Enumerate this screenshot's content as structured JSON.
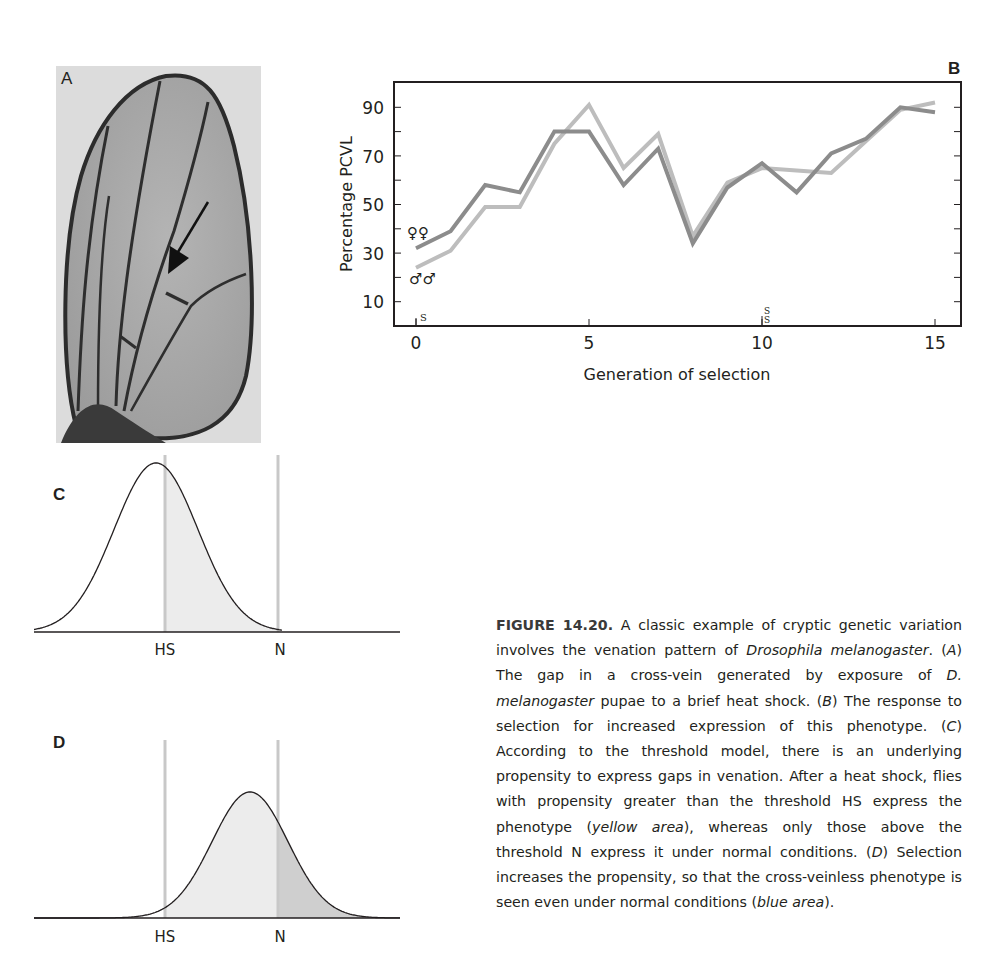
{
  "panels": {
    "A": {
      "label": "A",
      "description": "Drosophila wing photo with arrow pointing at gap in cross-vein"
    },
    "B": {
      "label": "B"
    },
    "C": {
      "label": "C"
    },
    "D": {
      "label": "D"
    }
  },
  "chart_data": [
    {
      "panel": "B",
      "type": "line",
      "title": "",
      "xlabel": "Generation of selection",
      "ylabel": "Percentage PCVL",
      "xlim": [
        0,
        15
      ],
      "ylim": [
        0,
        100
      ],
      "x_ticks": [
        0,
        5,
        10,
        15
      ],
      "y_ticks": [
        10,
        30,
        50,
        70,
        90
      ],
      "y_minor_ticks": [
        20,
        40,
        60,
        80
      ],
      "grid": false,
      "x": [
        0,
        1,
        2,
        3,
        4,
        5,
        6,
        7,
        8,
        9,
        10,
        11,
        12,
        13,
        14,
        15
      ],
      "series": [
        {
          "name": "♀♀ (females)",
          "symbol": "♀♀",
          "color": "#8c8c8c",
          "values": [
            32,
            39,
            58,
            55,
            80,
            80,
            58,
            73,
            34,
            57,
            67,
            55,
            71,
            77,
            90,
            88
          ]
        },
        {
          "name": "♂♂ (males)",
          "symbol": "♂♂",
          "color": "#bdbdbd",
          "values": [
            24,
            31,
            49,
            49,
            75,
            91,
            65,
            79,
            37,
            59,
            65,
            64,
            63,
            76,
            89,
            92
          ]
        }
      ],
      "annotations": [
        {
          "text": "S",
          "x": 0,
          "note": "small marker near x-axis"
        },
        {
          "text": "S S",
          "x": 10,
          "note": "stacked small markers near x-axis"
        }
      ],
      "legend_position": "inline at start of lines"
    },
    {
      "panel": "C",
      "type": "area",
      "description": "Normal distribution of propensity; area right of threshold HS shaded",
      "thresholds": [
        {
          "label": "HS",
          "position": 0.41
        },
        {
          "label": "N",
          "position": 0.73
        }
      ],
      "mean_position": 0.39,
      "shaded_regions": [
        {
          "from": "HS",
          "to": "N",
          "color": "#ebebeb",
          "meaning": "yellow area"
        }
      ]
    },
    {
      "panel": "D",
      "type": "area",
      "description": "Distribution shifted right after selection; area beyond HS light, area beyond N darker",
      "thresholds": [
        {
          "label": "HS",
          "position": 0.41
        },
        {
          "label": "N",
          "position": 0.73
        }
      ],
      "mean_position": 0.66,
      "shaded_regions": [
        {
          "from": "HS",
          "to": "N",
          "color": "#ececec",
          "meaning": "yellow area"
        },
        {
          "from": "N",
          "to": "end",
          "color": "#cfcfcf",
          "meaning": "blue area"
        }
      ]
    }
  ],
  "chartB": {
    "xlabel": "Generation of selection",
    "ylabel": "Percentage PCVL",
    "x_tick_labels": [
      "0",
      "5",
      "10",
      "15"
    ],
    "y_tick_labels": [
      "90",
      "70",
      "50",
      "30",
      "10"
    ],
    "female_symbol": "♀♀",
    "male_symbol": "♂♂",
    "marker_s": "S"
  },
  "thresholds": {
    "hs": "HS",
    "n": "N"
  },
  "caption": {
    "figure_id": "FIGURE 14.20.",
    "seg1": " A classic example of cryptic genetic variation involves the venation pattern of ",
    "drosophila": "Drosophila melanogaster",
    "seg2": ". (",
    "A": "A",
    "seg3": ") The gap in a cross-vein generated by exposure of ",
    "d_mel": "D. melanogaster",
    "seg4": " pupae to a brief heat shock. (",
    "B": "B",
    "seg5": ") The response to selection for increased expression of this phenotype. (",
    "C": "C",
    "seg6": ") According to the threshold model, there is an underlying propensity to express gaps in venation. After a heat shock, flies with propensity greater than the threshold HS express the phenotype (",
    "yellow": "yellow area",
    "seg7": "), whereas only those above the threshold N express it under normal conditions. (",
    "D": "D",
    "seg8": ") Selection increases the propensity, so that the cross-veinless phenotype is seen even under normal conditions (",
    "blue": "blue area",
    "seg9": ")."
  },
  "colors": {
    "female_line": "#8c8c8c",
    "male_line": "#bdbdbd",
    "threshold_line": "#c8c8c8",
    "shade_light": "#ececec",
    "shade_dark": "#cfcfcf",
    "text": "#231f20"
  }
}
